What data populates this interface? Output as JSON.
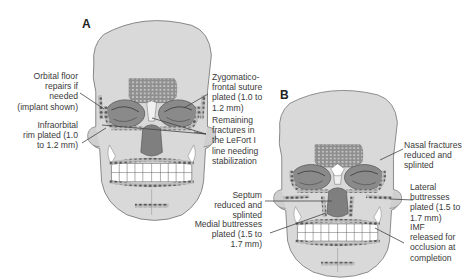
{
  "figure": {
    "panels": [
      {
        "id": "A",
        "letter": "A",
        "labels": {
          "orbital_floor": "Orbital floor\nrepairs if\nneeded\n(implant shown)",
          "infraorbital_rim": "Infraorbital\nrim plated (1.0\nto 1.2 mm)",
          "zygomaticofrontal": "Zygomatico-\nfrontal suture\nplated (1.0 to\n1.2 mm)",
          "remaining_fractures": "Remaining\nfractures in\nthe LeFort I\nline needing\nstabilization"
        }
      },
      {
        "id": "B",
        "letter": "B",
        "labels": {
          "nasal_fractures": "Nasal fractures\nreduced and\nsplinted",
          "septum": "Septum\nreduced and\nsplinted",
          "lateral_buttresses": "Lateral\nbuttresses\nplated (1.5 to\n1.7 mm)",
          "medial_buttresses": "Medial buttresses\nplated (1.5 to\n1.7 mm)",
          "imf": "IMF\nreleased for\nocclusion at\ncompletion"
        }
      }
    ],
    "colors": {
      "skull_fill": "#d9d9d9",
      "skull_outline": "#6a6a6a",
      "orbit_fill": "#8a8a8a",
      "mesh_fill": "#9a9a9a",
      "plate_fill": "#6e6e6e",
      "teeth_fill": "#ffffff",
      "leader_line": "#444444",
      "text": "#3a3a3a"
    }
  }
}
